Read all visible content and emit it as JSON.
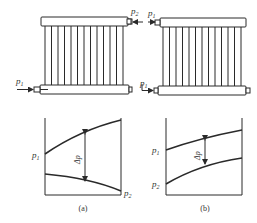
{
  "diagram": {
    "panels": [
      {
        "id": "a",
        "caption": "(a)",
        "radiator": {
          "inlet_label": "p",
          "inlet_sub": "1",
          "tube_count": 13
        },
        "graph": {
          "upper_label": "p",
          "upper_sub": "1",
          "lower_label": "p",
          "lower_sub": "2",
          "delta_label": "Δp"
        }
      },
      {
        "id": "b",
        "caption": "(b)",
        "radiator": {
          "inlet_label": "p",
          "inlet_sub": "1",
          "outlet_label": "p",
          "outlet_sub": "2",
          "top_inlet_label": "p",
          "top_inlet_sub": "1",
          "tube_count": 13
        },
        "graph": {
          "upper_label": "p",
          "upper_sub": "1",
          "lower_label": "p",
          "lower_sub": "2",
          "delta_label": "Δp"
        }
      }
    ],
    "colors": {
      "stroke": "#2a2a2a",
      "text": "#333333"
    }
  }
}
